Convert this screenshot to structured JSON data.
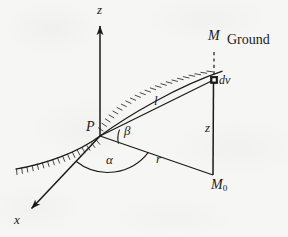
{
  "figure": {
    "kind": "geometry-diagram",
    "caption_absent": true,
    "background_color": "#f6f6f5",
    "ink_color": "#1a1a1a",
    "labels": {
      "z_axis": "z",
      "x_axis": "x",
      "origin_point": "P",
      "surface_point": "M",
      "ground_text": "Ground",
      "volume_element": "dv",
      "slant_distance": "l",
      "horizontal_distance": "r",
      "depth": "z",
      "projected_point": "M",
      "projected_point_sub": "0",
      "angle_beta": "β",
      "angle_alpha": "α"
    },
    "icons": {
      "z_axis_arrow": "arrow-up-icon",
      "x_axis_arrow": "arrow-down-left-icon",
      "dv_marker": "filled-square-icon",
      "ground_hatching": "hatched-surface-icon",
      "dashed_drop_line": "dashed-line-icon",
      "angle_arc_alpha": "arc-icon",
      "angle_arc_beta": "arc-icon"
    },
    "geometry": {
      "P": [
        100,
        136
      ],
      "M": [
        222,
        48
      ],
      "dv": [
        214,
        80
      ],
      "M0": [
        213,
        175
      ],
      "z_axis_tip": [
        100,
        22
      ],
      "x_axis_tip": [
        28,
        211
      ]
    }
  }
}
